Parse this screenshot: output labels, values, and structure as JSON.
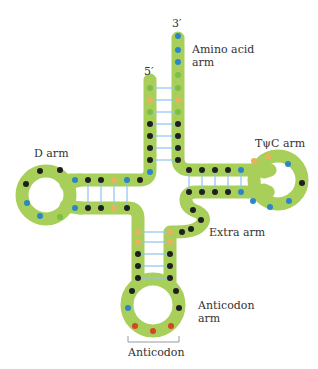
{
  "labels": {
    "three_prime": "3′",
    "five_prime": "5′",
    "amino_acid_arm": "Amino acid",
    "amino_acid_arm_line2": "arm",
    "d_arm": "D arm",
    "tpsic_arm": "TψC arm",
    "extra_arm": "Extra arm",
    "anticodon_arm": "Anticodon",
    "anticodon_arm_line2": "arm",
    "anticodon": "Anticodon"
  },
  "colors": {
    "backbone": "#a8cf5a",
    "base_black": "#1f1f1f",
    "base_blue": "#2b86c5",
    "base_green": "#7cbf45",
    "base_orange": "#e9b25a",
    "base_red": "#d8412a",
    "hbond": "#8ec3e8",
    "bracket": "#999999"
  }
}
